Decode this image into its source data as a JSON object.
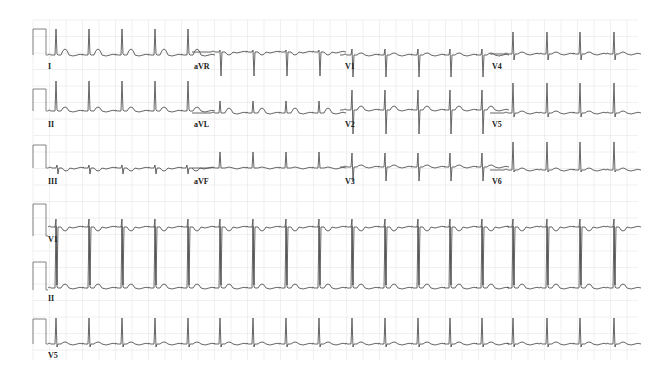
{
  "chart_data": {
    "type": "line",
    "xlabel": "",
    "ylabel": "",
    "grid": true,
    "grid_color": "#ececec",
    "trace_color": "#555555",
    "layout": "3x4 + 3 rhythm strips",
    "beat_interval_px": 33,
    "leads": [
      {
        "name": "I",
        "row": 0,
        "x0": 48,
        "x1": 192,
        "baseline": 55,
        "r": 26,
        "s": 1,
        "t": 6,
        "beats": [
          56,
          89,
          122,
          155,
          188
        ]
      },
      {
        "name": "aVR",
        "row": 0,
        "x0": 192,
        "x1": 340,
        "baseline": 52,
        "r": 2,
        "s": -24,
        "t": -3,
        "beats": [
          220,
          253,
          286,
          319
        ]
      },
      {
        "name": "V1",
        "row": 0,
        "x0": 340,
        "x1": 490,
        "baseline": 55,
        "r": 6,
        "s": -22,
        "t": 2,
        "beats": [
          352,
          385,
          418,
          450,
          482
        ]
      },
      {
        "name": "V4",
        "row": 0,
        "x0": 490,
        "x1": 636,
        "baseline": 54,
        "r": 22,
        "s": -6,
        "t": 2,
        "beats": [
          513,
          547,
          580,
          614
        ]
      },
      {
        "name": "II",
        "row": 1,
        "x0": 48,
        "x1": 192,
        "baseline": 111,
        "r": 30,
        "s": 1,
        "t": 4,
        "beats": [
          56,
          89,
          122,
          155,
          188
        ]
      },
      {
        "name": "aVL",
        "row": 1,
        "x0": 192,
        "x1": 340,
        "baseline": 113,
        "r": 12,
        "s": 0,
        "t": 5,
        "beats": [
          220,
          253,
          286,
          319
        ]
      },
      {
        "name": "V2",
        "row": 1,
        "x0": 340,
        "x1": 490,
        "baseline": 110,
        "r": 20,
        "s": -24,
        "t": 4,
        "beats": [
          352,
          385,
          418,
          450,
          482
        ]
      },
      {
        "name": "V5",
        "row": 1,
        "x0": 490,
        "x1": 636,
        "baseline": 113,
        "r": 30,
        "s": -4,
        "t": 2,
        "beats": [
          513,
          547,
          580,
          614
        ]
      },
      {
        "name": "III",
        "row": 2,
        "x0": 48,
        "x1": 192,
        "baseline": 168,
        "r": 3,
        "s": -6,
        "t": -3,
        "beats": [
          57,
          89,
          122,
          155,
          187
        ]
      },
      {
        "name": "aVF",
        "row": 2,
        "x0": 192,
        "x1": 340,
        "baseline": 168,
        "r": 16,
        "s": 0,
        "t": 1,
        "beats": [
          220,
          253,
          286,
          319
        ]
      },
      {
        "name": "V3",
        "row": 2,
        "x0": 340,
        "x1": 490,
        "baseline": 167,
        "r": 14,
        "s": -14,
        "t": 2,
        "beats": [
          352,
          385,
          418,
          450,
          482
        ]
      },
      {
        "name": "V6",
        "row": 2,
        "x0": 490,
        "x1": 636,
        "baseline": 170,
        "r": 28,
        "s": -2,
        "t": 2,
        "beats": [
          513,
          547,
          580,
          614
        ]
      },
      {
        "name": "V1",
        "row": 3,
        "x0": 48,
        "x1": 638,
        "baseline": 227,
        "r": 8,
        "s": -58,
        "t": -4,
        "beats": [
          56,
          89,
          122,
          155,
          188,
          220,
          253,
          286,
          319,
          352,
          385,
          418,
          450,
          482,
          513,
          547,
          580,
          614
        ]
      },
      {
        "name": "II",
        "row": 4,
        "x0": 48,
        "x1": 638,
        "baseline": 288,
        "r": 62,
        "s": 1,
        "t": 4,
        "beats": [
          56,
          89,
          122,
          155,
          188,
          220,
          253,
          286,
          319,
          352,
          385,
          418,
          450,
          482,
          513,
          547,
          580,
          614
        ]
      },
      {
        "name": "V5",
        "row": 5,
        "x0": 48,
        "x1": 638,
        "baseline": 344,
        "r": 26,
        "s": -3,
        "t": 2,
        "beats": [
          56,
          89,
          122,
          155,
          188,
          220,
          253,
          286,
          319,
          352,
          385,
          418,
          450,
          482,
          513,
          547,
          580,
          614
        ]
      }
    ],
    "calibration_pulses": [
      {
        "x": 33,
        "width": 13,
        "top": 29,
        "base": 55
      },
      {
        "x": 33,
        "width": 13,
        "top": 89,
        "base": 111
      },
      {
        "x": 33,
        "width": 13,
        "top": 145,
        "base": 168
      },
      {
        "x": 33,
        "width": 13,
        "top": 204,
        "base": 236
      },
      {
        "x": 33,
        "width": 13,
        "top": 262,
        "base": 290
      },
      {
        "x": 33,
        "width": 13,
        "top": 319,
        "base": 344
      }
    ],
    "labels": [
      {
        "text": "I",
        "x": 48,
        "y": 62
      },
      {
        "text": "aVR",
        "x": 194,
        "y": 62
      },
      {
        "text": "V1",
        "x": 345,
        "y": 62
      },
      {
        "text": "V4",
        "x": 492,
        "y": 62
      },
      {
        "text": "II",
        "x": 48,
        "y": 120
      },
      {
        "text": "aVL",
        "x": 194,
        "y": 120
      },
      {
        "text": "V2",
        "x": 345,
        "y": 120
      },
      {
        "text": "V5",
        "x": 492,
        "y": 120
      },
      {
        "text": "III",
        "x": 48,
        "y": 177
      },
      {
        "text": "aVF",
        "x": 194,
        "y": 177
      },
      {
        "text": "V3",
        "x": 345,
        "y": 177
      },
      {
        "text": "V6",
        "x": 492,
        "y": 177
      },
      {
        "text": "V1",
        "x": 48,
        "y": 235
      },
      {
        "text": "II",
        "x": 48,
        "y": 294
      },
      {
        "text": "V5",
        "x": 48,
        "y": 351
      }
    ],
    "grid_box": {
      "x": 33,
      "y": 20,
      "x1": 638,
      "y1": 360,
      "major": 16.5
    }
  }
}
